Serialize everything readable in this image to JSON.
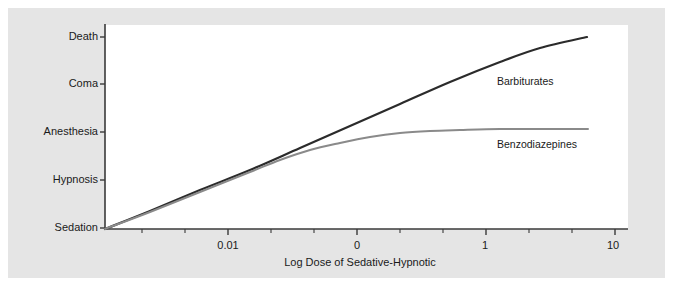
{
  "figure": {
    "background_color": "#ffffff",
    "panel_color": "#e5e5e5",
    "plot_color": "#ffffff"
  },
  "chart_data": {
    "type": "line",
    "title": "",
    "xlabel": "Log Dose of Sedative-Hypnotic",
    "ylabel": "",
    "grid": false,
    "legend_position": "inline-right",
    "x_tick_labels": [
      "0.01",
      "0",
      "1",
      "10"
    ],
    "x_tick_label_positions": [
      228,
      357,
      485,
      613
    ],
    "x_minor_tick_count": 12,
    "y_tick_labels": [
      "Death",
      "Coma",
      "Anesthesia",
      "Hypnosis",
      "Sedation"
    ],
    "y_tick_label_positions": [
      37,
      84,
      132,
      180,
      228
    ],
    "xlim": [
      105,
      628
    ],
    "ylim": [
      229,
      25
    ],
    "series": [
      {
        "name": "Barbiturates",
        "color": "#2b2b2b",
        "line_width": 2.2,
        "points": [
          [
            105,
            229
          ],
          [
            150,
            211
          ],
          [
            200,
            190
          ],
          [
            250,
            170
          ],
          [
            300,
            148
          ],
          [
            350,
            126
          ],
          [
            400,
            104
          ],
          [
            450,
            82
          ],
          [
            500,
            62
          ],
          [
            540,
            48
          ],
          [
            587,
            37
          ]
        ]
      },
      {
        "name": "Benzodiazepines",
        "color": "#8a8a8a",
        "line_width": 2.0,
        "points": [
          [
            105,
            229
          ],
          [
            150,
            212
          ],
          [
            200,
            192
          ],
          [
            250,
            172
          ],
          [
            280,
            160
          ],
          [
            310,
            150
          ],
          [
            340,
            143
          ],
          [
            370,
            137
          ],
          [
            400,
            133
          ],
          [
            430,
            131
          ],
          [
            460,
            130
          ],
          [
            500,
            129
          ],
          [
            545,
            129
          ],
          [
            588,
            129
          ]
        ]
      }
    ],
    "annotations": [
      {
        "text": "Barbiturates",
        "x": 497,
        "y": 75
      },
      {
        "text": "Benzodiazepines",
        "x": 497,
        "y": 138
      }
    ]
  },
  "axis": {
    "x_title": "Log Dose of Sedative-Hypnotic",
    "ticks_x": [
      {
        "label": "0.01",
        "x": 228
      },
      {
        "label": "0",
        "x": 357
      },
      {
        "label": "1",
        "x": 485
      },
      {
        "label": "10",
        "x": 613
      }
    ],
    "ticks_y": [
      {
        "label": "Death",
        "y": 37
      },
      {
        "label": "Coma",
        "y": 84
      },
      {
        "label": "Anesthesia",
        "y": 132
      },
      {
        "label": "Hypnosis",
        "y": 180
      },
      {
        "label": "Sedation",
        "y": 228
      }
    ]
  },
  "series_labels": {
    "barbiturates": "Barbiturates",
    "benzodiazepines": "Benzodiazepines"
  }
}
